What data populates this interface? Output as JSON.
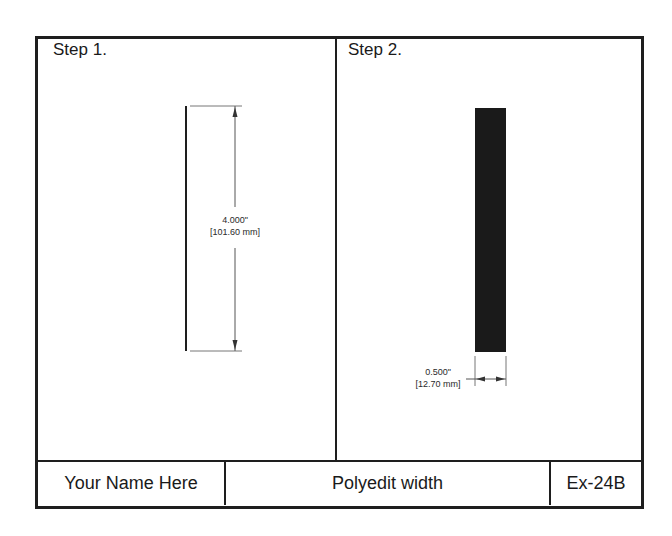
{
  "panels": [
    {
      "label": "Step 1.",
      "dimension": {
        "value_in": "4.000\"",
        "value_mm": "[101.60 mm]"
      }
    },
    {
      "label": "Step 2.",
      "dimension": {
        "value_in": "0.500\"",
        "value_mm": "[12.70 mm]"
      }
    }
  ],
  "title_block": {
    "name": "Your Name Here",
    "title": "Polyedit width",
    "exercise": "Ex-24B"
  },
  "colors": {
    "line": "#1e1e1e",
    "dimension": "#555555",
    "fill": "#1a1a1a"
  }
}
